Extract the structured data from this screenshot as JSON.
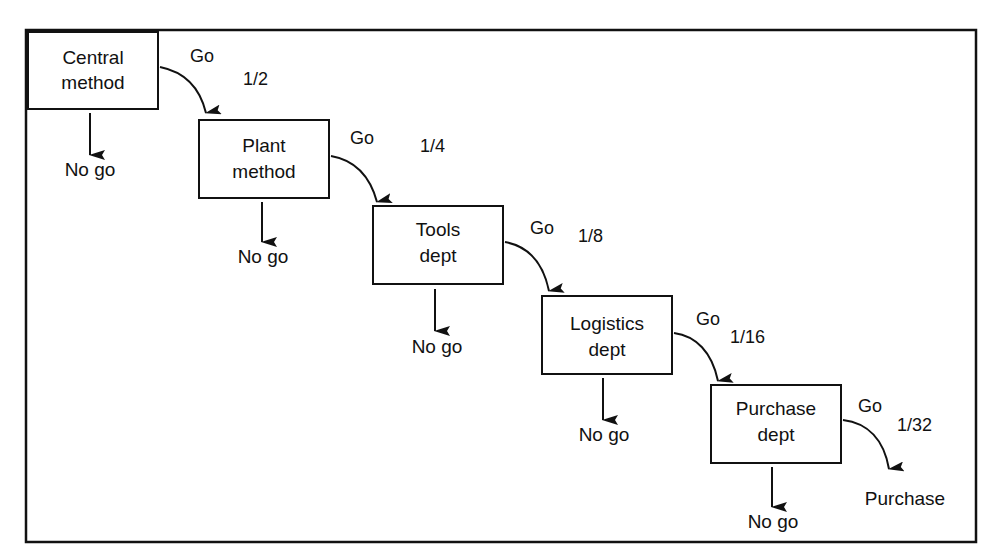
{
  "diagram": {
    "type": "flowchart",
    "colors": {
      "stroke": "#111111",
      "background": "#ffffff",
      "text": "#111111"
    },
    "frame": {
      "x": 26,
      "y": 30,
      "w": 950,
      "h": 512
    },
    "nodes": [
      {
        "id": "central",
        "line1": "Central",
        "line2": "method",
        "x": 28,
        "y": 32,
        "w": 130,
        "h": 77
      },
      {
        "id": "plant",
        "line1": "Plant",
        "line2": "method",
        "x": 199,
        "y": 120,
        "w": 130,
        "h": 78
      },
      {
        "id": "tools",
        "line1": "Tools",
        "line2": "dept",
        "x": 373,
        "y": 206,
        "w": 130,
        "h": 78
      },
      {
        "id": "logistics",
        "line1": "Logistics",
        "line2": "dept",
        "x": 542,
        "y": 296,
        "w": 130,
        "h": 78
      },
      {
        "id": "purchase",
        "line1": "Purchase",
        "line2": "dept",
        "x": 711,
        "y": 385,
        "w": 130,
        "h": 78
      }
    ],
    "go_labels": [
      {
        "text": "Go",
        "x": 190,
        "y": 62
      },
      {
        "text": "Go",
        "x": 350,
        "y": 144
      },
      {
        "text": "Go",
        "x": 530,
        "y": 234
      },
      {
        "text": "Go",
        "x": 696,
        "y": 325
      },
      {
        "text": "Go",
        "x": 858,
        "y": 412
      }
    ],
    "fractions": [
      {
        "text": "1/2",
        "x": 243,
        "y": 85
      },
      {
        "text": "1/4",
        "x": 420,
        "y": 152
      },
      {
        "text": "1/8",
        "x": 578,
        "y": 242
      },
      {
        "text": "1/16",
        "x": 730,
        "y": 343
      },
      {
        "text": "1/32",
        "x": 897,
        "y": 431
      }
    ],
    "no_go_labels": [
      {
        "text": "No go",
        "x": 90,
        "y": 176
      },
      {
        "text": "No go",
        "x": 263,
        "y": 263
      },
      {
        "text": "No go",
        "x": 437,
        "y": 353
      },
      {
        "text": "No go",
        "x": 604,
        "y": 441
      },
      {
        "text": "No go",
        "x": 773,
        "y": 528
      }
    ],
    "final": {
      "text": "Purchase",
      "x": 905,
      "y": 505
    }
  }
}
